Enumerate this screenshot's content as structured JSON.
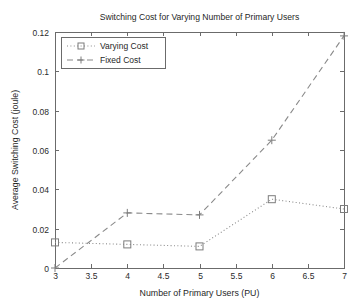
{
  "chart_data": {
    "type": "line",
    "title": "Switching Cost for Varying Number of Primary Users",
    "xlabel": "Number of Primary Users (PU)",
    "ylabel": "Average Switching Cost (joule)",
    "x": [
      3,
      4,
      5,
      6,
      7
    ],
    "xlim": [
      3,
      7
    ],
    "ylim": [
      0,
      0.12
    ],
    "xticks": [
      3,
      3.5,
      4,
      4.5,
      5,
      5.5,
      6,
      6.5,
      7
    ],
    "xticklabels": [
      "3",
      "3.5",
      "4",
      "4.5",
      "5",
      "5.5",
      "6",
      "6.5",
      "7"
    ],
    "yticks": [
      0,
      0.02,
      0.04,
      0.06,
      0.08,
      0.1,
      0.12
    ],
    "yticklabels": [
      "0",
      "0.02",
      "0.04",
      "0.06",
      "0.08",
      "0.1",
      "0.12"
    ],
    "grid": false,
    "legend_position": "upper left",
    "series": [
      {
        "name": "Varying Cost",
        "values": [
          0.013,
          0.012,
          0.011,
          0.035,
          0.03
        ],
        "linestyle": "dotted",
        "marker": "square",
        "color": "#8a8a8a"
      },
      {
        "name": "Fixed Cost",
        "values": [
          0.0,
          0.028,
          0.027,
          0.065,
          0.118
        ],
        "linestyle": "dashed",
        "marker": "plus",
        "color": "#8a8a8a"
      }
    ]
  },
  "legend": {
    "entries": [
      {
        "label": "Varying Cost"
      },
      {
        "label": "Fixed Cost"
      }
    ]
  },
  "figure": {
    "background": "#ffffff",
    "axis_color": "#6b6b6b",
    "series_color": "#8a8a8a"
  }
}
